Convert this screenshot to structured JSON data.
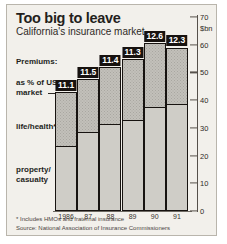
{
  "header": {
    "title": "Too big to leave",
    "subtitle": "California's insurance market"
  },
  "annotations": {
    "premiums": "Premiums:",
    "pct_line1": "as % of US",
    "pct_line2": "market",
    "life_health": "life/health*",
    "property_line1": "property/",
    "property_line2": "casualty"
  },
  "footnotes": {
    "note": "* Includes HMOs and fraternal insurance",
    "source": "Source: National Association of Insurance Commissioners"
  },
  "chart_data": {
    "type": "bar",
    "title": "Too big to leave",
    "subtitle": "California's insurance market",
    "xlabel": "",
    "ylabel": "$bn",
    "unit_label": "$bn",
    "ylim": [
      0,
      70
    ],
    "yticks": [
      0,
      10,
      20,
      30,
      40,
      50,
      60,
      70
    ],
    "ytick_labels": [
      "0",
      "10",
      "20",
      "30",
      "40",
      "50",
      "60",
      "70"
    ],
    "grid": false,
    "legend_position": "left-annotations",
    "categories": [
      "1986",
      "87",
      "88",
      "89",
      "90",
      "91"
    ],
    "data_labels": [
      "11.1",
      "11.5",
      "11.4",
      "11.3",
      "12.6",
      "12.3"
    ],
    "data_label_meaning": "Premiums as % of US market",
    "stacked": true,
    "series": [
      {
        "name": "property/casualty",
        "values": [
          23.5,
          28.5,
          31.5,
          33.0,
          37.5,
          38.5
        ]
      },
      {
        "name": "life/health*",
        "values": [
          19.5,
          19.0,
          20.5,
          22.0,
          23.0,
          20.5
        ]
      }
    ],
    "totals": [
      43.0,
      47.5,
      52.0,
      55.0,
      60.5,
      59.0
    ]
  },
  "colors": {
    "panel_background": "#f2f0eb",
    "bar_outline": "#171310",
    "bar_lower_fill": "#cfcdc7",
    "bar_upper_fill": "#c2c0ba",
    "label_badge_background": "#17120f",
    "label_badge_text": "#ffffff",
    "text": "#241f1c",
    "axis": "#56514b"
  }
}
